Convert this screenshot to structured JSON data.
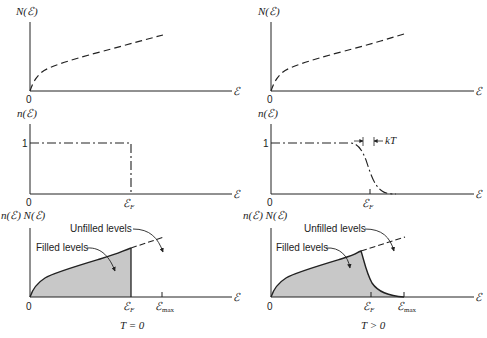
{
  "figure": {
    "left_column": {
      "caption": "T = 0",
      "panel_density_of_states": {
        "y_label": "N(ℰ)",
        "x_label": "ℰ",
        "origin": "0"
      },
      "panel_occupation": {
        "y_label": "n(ℰ)",
        "x_label": "ℰ",
        "origin": "0",
        "level_one": "1",
        "fermi_label": "ℰ",
        "fermi_sub": "F"
      },
      "panel_product": {
        "y_label": "n(ℰ) N(ℰ)",
        "x_label": "ℰ",
        "origin": "0",
        "fermi_label": "ℰ",
        "fermi_sub": "F",
        "max_label": "ℰ",
        "max_sub": "max",
        "filled_annotation": "Filled levels",
        "unfilled_annotation": "Unfilled levels"
      }
    },
    "right_column": {
      "caption": "T > 0",
      "panel_density_of_states": {
        "y_label": "N(ℰ)",
        "x_label": "ℰ",
        "origin": "0"
      },
      "panel_occupation": {
        "y_label": "n(ℰ)",
        "x_label": "ℰ",
        "origin": "0",
        "level_one": "1",
        "fermi_label": "ℰ",
        "fermi_sub": "F",
        "width_label": "kT"
      },
      "panel_product": {
        "y_label": "n(ℰ) N(ℰ)",
        "x_label": "ℰ",
        "origin": "0",
        "fermi_label": "ℰ",
        "fermi_sub": "F",
        "max_label": "ℰ",
        "max_sub": "max",
        "filled_annotation": "Filled levels",
        "unfilled_annotation": "Unfilled levels"
      }
    },
    "colors": {
      "ink": "#222222",
      "fill": "#c8c8c8"
    }
  }
}
